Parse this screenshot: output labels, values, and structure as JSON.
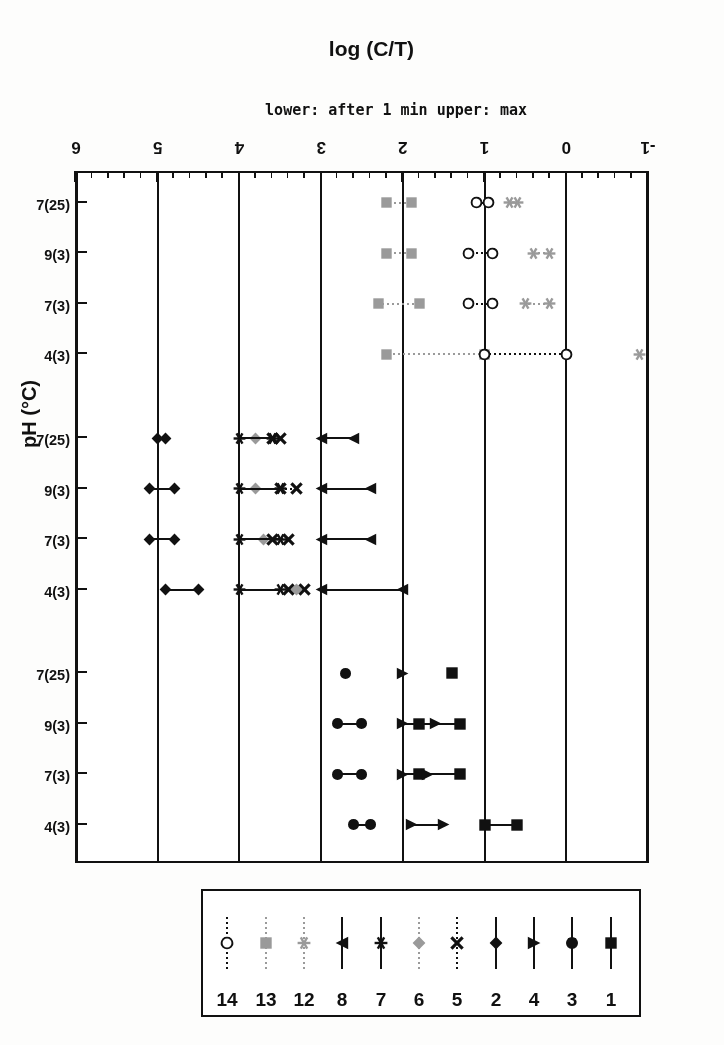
{
  "figure": {
    "y_axis_title": "log (C/T)",
    "y_axis_sublabel": "lower: after 1 min   upper: max",
    "x_axis_title": "pH (°C)",
    "ink_color": "#111111",
    "gray_color": "#9a9a9a",
    "background": "#ffffff"
  },
  "legend": {
    "entries": [
      {
        "label": "1",
        "marker": "filled-square",
        "color": "#111111",
        "line": "solid"
      },
      {
        "label": "3",
        "marker": "filled-circle",
        "color": "#111111",
        "line": "solid"
      },
      {
        "label": "4",
        "marker": "left-triangle",
        "color": "#111111",
        "line": "solid"
      },
      {
        "label": "2",
        "marker": "filled-diamond",
        "color": "#111111",
        "line": "solid"
      },
      {
        "label": "5",
        "marker": "cross-x",
        "color": "#111111",
        "line": "dotted"
      },
      {
        "label": "6",
        "marker": "filled-diamond",
        "color": "#9a9a9a",
        "line": "dotted"
      },
      {
        "label": "7",
        "marker": "star",
        "color": "#111111",
        "line": "solid"
      },
      {
        "label": "8",
        "marker": "right-triangle",
        "color": "#111111",
        "line": "solid"
      },
      {
        "label": "12",
        "marker": "star",
        "color": "#9a9a9a",
        "line": "dotted"
      },
      {
        "label": "13",
        "marker": "filled-square",
        "color": "#9a9a9a",
        "line": "dotted"
      },
      {
        "label": "14",
        "marker": "open-circle",
        "color": "#111111",
        "line": "dotted"
      }
    ]
  },
  "chart_data": {
    "type": "scatter",
    "title": "",
    "xlabel": "pH (°C)",
    "ylabel": "log (C/T)",
    "ylabel_secondary": "lower: after 1 min   upper: max",
    "ylim": [
      -1,
      6
    ],
    "y_ticks": [
      -1,
      0,
      1,
      2,
      3,
      4,
      5,
      6
    ],
    "y_minor_tick_step": 0.2,
    "grid": "major-y-only",
    "legend_position": "above-plot",
    "orientation": "page-rotated-180",
    "categories": [
      "4(3)",
      "7(3)",
      "9(3)",
      "7(25)",
      "4(3)",
      "7(3)",
      "9(3)",
      "7(25)",
      "4(3)",
      "7(3)",
      "9(3)",
      "7(25)"
    ],
    "category_groups": [
      {
        "name": "group-1",
        "categories": [
          "4(3)",
          "7(3)",
          "9(3)",
          "7(25)"
        ],
        "series": [
          "1",
          "3",
          "4"
        ]
      },
      {
        "name": "group-2",
        "categories": [
          "4(3)",
          "7(3)",
          "9(3)",
          "7(25)"
        ],
        "series": [
          "2",
          "5",
          "6",
          "7",
          "8"
        ]
      },
      {
        "name": "group-3",
        "categories": [
          "4(3)",
          "7(3)",
          "9(3)",
          "7(25)"
        ],
        "series": [
          "12",
          "13",
          "14"
        ]
      }
    ],
    "value_note": "each plotted item is a horizontal range: low end = value after 1 min, high end = max",
    "series": [
      {
        "name": "1",
        "marker": "filled-square",
        "color": "#111111",
        "line": "solid",
        "ranges": [
          {
            "category_index": 0,
            "low": 0.6,
            "high": 1.0
          },
          {
            "category_index": 1,
            "low": 1.3,
            "high": 1.8
          },
          {
            "category_index": 2,
            "low": 1.3,
            "high": 1.8
          },
          {
            "category_index": 3,
            "low": 1.4,
            "high": 1.4
          }
        ]
      },
      {
        "name": "3",
        "marker": "filled-circle",
        "color": "#111111",
        "line": "solid",
        "ranges": [
          {
            "category_index": 0,
            "low": 2.4,
            "high": 2.6
          },
          {
            "category_index": 1,
            "low": 2.5,
            "high": 2.8
          },
          {
            "category_index": 2,
            "low": 2.5,
            "high": 2.8
          },
          {
            "category_index": 3,
            "low": 2.7,
            "high": 2.7
          }
        ]
      },
      {
        "name": "4",
        "marker": "left-triangle",
        "color": "#111111",
        "line": "solid",
        "ranges": [
          {
            "category_index": 0,
            "low": 1.5,
            "high": 1.9
          },
          {
            "category_index": 1,
            "low": 1.7,
            "high": 2.0
          },
          {
            "category_index": 2,
            "low": 1.6,
            "high": 2.0
          },
          {
            "category_index": 3,
            "low": 2.0,
            "high": 2.0
          }
        ]
      },
      {
        "name": "2",
        "marker": "filled-diamond",
        "color": "#111111",
        "line": "solid",
        "ranges": [
          {
            "category_index": 4,
            "low": 4.5,
            "high": 4.9
          },
          {
            "category_index": 5,
            "low": 4.8,
            "high": 5.1
          },
          {
            "category_index": 6,
            "low": 4.8,
            "high": 5.1
          },
          {
            "category_index": 7,
            "low": 4.9,
            "high": 5.0
          }
        ]
      },
      {
        "name": "5",
        "marker": "cross-x",
        "color": "#111111",
        "line": "dotted",
        "ranges": [
          {
            "category_index": 4,
            "low": 3.2,
            "high": 3.4
          },
          {
            "category_index": 5,
            "low": 3.4,
            "high": 3.6
          },
          {
            "category_index": 6,
            "low": 3.3,
            "high": 3.5
          },
          {
            "category_index": 7,
            "low": 3.5,
            "high": 3.6
          }
        ]
      },
      {
        "name": "6",
        "marker": "filled-diamond",
        "color": "#9a9a9a",
        "line": "dotted",
        "ranges": [
          {
            "category_index": 4,
            "low": 3.3,
            "high": 3.3
          },
          {
            "category_index": 5,
            "low": 3.7,
            "high": 3.7
          },
          {
            "category_index": 6,
            "low": 3.8,
            "high": 3.8
          },
          {
            "category_index": 7,
            "low": 3.8,
            "high": 3.8
          }
        ]
      },
      {
        "name": "7",
        "marker": "star",
        "color": "#111111",
        "line": "solid",
        "ranges": [
          {
            "category_index": 4,
            "low": 3.5,
            "high": 4.0
          },
          {
            "category_index": 5,
            "low": 3.5,
            "high": 4.0
          },
          {
            "category_index": 6,
            "low": 3.5,
            "high": 4.0
          },
          {
            "category_index": 7,
            "low": 3.6,
            "high": 4.0
          }
        ]
      },
      {
        "name": "8",
        "marker": "right-triangle",
        "color": "#111111",
        "line": "solid",
        "ranges": [
          {
            "category_index": 4,
            "low": 2.0,
            "high": 3.0
          },
          {
            "category_index": 5,
            "low": 2.4,
            "high": 3.0
          },
          {
            "category_index": 6,
            "low": 2.4,
            "high": 3.0
          },
          {
            "category_index": 7,
            "low": 2.6,
            "high": 3.0
          }
        ]
      },
      {
        "name": "12",
        "marker": "star",
        "color": "#9a9a9a",
        "line": "dotted",
        "ranges": [
          {
            "category_index": 8,
            "low": -0.9,
            "high": -0.9
          },
          {
            "category_index": 9,
            "low": 0.2,
            "high": 0.5
          },
          {
            "category_index": 10,
            "low": 0.2,
            "high": 0.4
          },
          {
            "category_index": 11,
            "low": 0.6,
            "high": 0.7
          }
        ]
      },
      {
        "name": "13",
        "marker": "filled-square",
        "color": "#9a9a9a",
        "line": "dotted",
        "ranges": [
          {
            "category_index": 8,
            "low": 1.0,
            "high": 2.2
          },
          {
            "category_index": 9,
            "low": 1.8,
            "high": 2.3
          },
          {
            "category_index": 10,
            "low": 1.9,
            "high": 2.2
          },
          {
            "category_index": 11,
            "low": 1.9,
            "high": 2.2
          }
        ]
      },
      {
        "name": "14",
        "marker": "open-circle",
        "color": "#111111",
        "line": "dotted",
        "ranges": [
          {
            "category_index": 8,
            "low": 0.0,
            "high": 1.0
          },
          {
            "category_index": 9,
            "low": 0.9,
            "high": 1.2
          },
          {
            "category_index": 10,
            "low": 0.9,
            "high": 1.2
          },
          {
            "category_index": 11,
            "low": 0.95,
            "high": 1.1
          }
        ]
      }
    ]
  }
}
